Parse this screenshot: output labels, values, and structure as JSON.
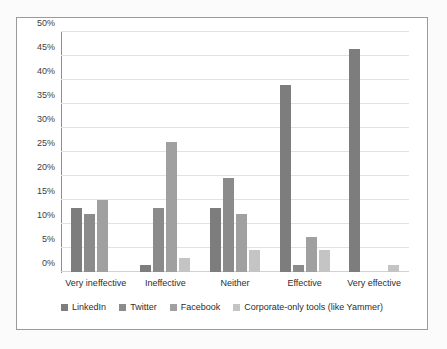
{
  "chart_data": {
    "type": "bar",
    "title": "",
    "subtitle": "",
    "xlabel": "",
    "ylabel": "",
    "ylim": [
      0,
      50
    ],
    "ytick_step": 5,
    "grid": true,
    "legend_position": "bottom",
    "value_unit": "%",
    "categories": [
      "Very ineffective",
      "Ineffective",
      "Neither",
      "Effective",
      "Very effective"
    ],
    "ytick_labels": [
      "0%",
      "5%",
      "10%",
      "15%",
      "20%",
      "25%",
      "30%",
      "35%",
      "40%",
      "45%",
      "50%"
    ],
    "series": [
      {
        "name": "LinkedIn",
        "color": "#7d7d7d",
        "values": [
          13.3,
          1.5,
          13.3,
          39.0,
          46.5
        ]
      },
      {
        "name": "Twitter",
        "color": "#8b8b8b",
        "values": [
          12.0,
          13.3,
          19.5,
          1.5,
          0
        ]
      },
      {
        "name": "Facebook",
        "color": "#a0a0a0",
        "values": [
          15.0,
          27.0,
          12.0,
          7.3,
          0
        ]
      },
      {
        "name": "Corporate-only tools (like Yammer)",
        "color": "#c4c4c4",
        "values": [
          0,
          3.0,
          4.5,
          4.5,
          1.5
        ]
      }
    ]
  }
}
